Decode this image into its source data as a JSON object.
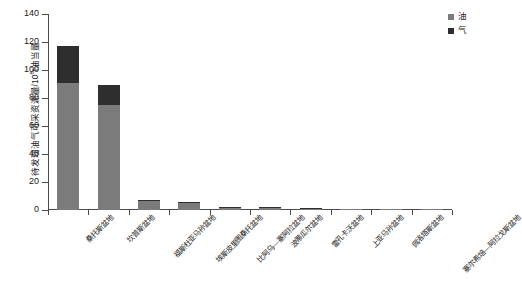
{
  "chart_data": {
    "type": "bar",
    "stacked": true,
    "title": "",
    "xlabel": "",
    "ylabel": "待发现油气可采资源量/10⁸t油当量",
    "ylabel_parts": {
      "prefix": "待发现油气可采资源量/10",
      "exponent": "8",
      "suffix": "t油当量"
    },
    "ylim": [
      0,
      140
    ],
    "yticks": [
      0,
      20,
      40,
      60,
      80,
      100,
      120,
      140
    ],
    "ytick_labels": [
      "0",
      "20",
      "40",
      "60",
      "80",
      "100",
      "120",
      "140"
    ],
    "grid": false,
    "legend_position": "top-right",
    "categories": [
      "桑托斯盆地",
      "坎普斯盆地",
      "福斯杜亚马孙盆地",
      "埃斯皮里图桑托盆地",
      "比阿乌—塞阿拉盆地",
      "波蒂瓜尔盆地",
      "雷孔卡沃盆地",
      "上亚马孙盆地",
      "佩洛塔斯盆地",
      "塞尔希培—阿拉戈斯盆地"
    ],
    "series": [
      {
        "name": "油",
        "color": "#7b7b7b",
        "values": [
          91,
          75,
          7,
          5.5,
          2.2,
          1.8,
          1.1,
          0.9,
          0.7,
          0.5
        ]
      },
      {
        "name": "气",
        "color": "#2e2e2e",
        "values": [
          26,
          14,
          0.3,
          0.2,
          0.1,
          0.1,
          0.1,
          0.05,
          0.05,
          0.05
        ]
      }
    ],
    "totals": [
      117,
      89,
      7.3,
      5.7,
      2.3,
      1.9,
      1.2,
      0.95,
      0.75,
      0.55
    ]
  },
  "legend": {
    "items": [
      {
        "label": "油",
        "color": "#7b7b7b"
      },
      {
        "label": "气",
        "color": "#2e2e2e"
      }
    ]
  }
}
